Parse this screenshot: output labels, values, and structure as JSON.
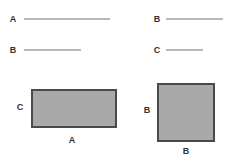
{
  "diagram": {
    "segments": [
      {
        "label": "A",
        "label_x": 13,
        "label_y": 19,
        "x1": 24,
        "x2": 110,
        "y": 19
      },
      {
        "label": "B",
        "label_x": 13,
        "label_y": 50,
        "x1": 24,
        "x2": 81,
        "y": 50
      },
      {
        "label": "B",
        "label_x": 157,
        "label_y": 19,
        "x1": 166,
        "x2": 223,
        "y": 19
      },
      {
        "label": "C",
        "label_x": 157,
        "label_y": 50,
        "x1": 166,
        "x2": 203,
        "y": 50
      }
    ],
    "rectangles": [
      {
        "name": "rectangle-A-by-C",
        "x": 31,
        "y": 89,
        "w": 86,
        "h": 39,
        "side_label": "C",
        "side_label_x": 20,
        "side_label_y": 107,
        "bottom_label": "A",
        "bottom_label_x": 72,
        "bottom_label_y": 140
      },
      {
        "name": "square-B-by-B",
        "x": 157,
        "y": 83,
        "w": 58,
        "h": 59,
        "side_label": "B",
        "side_label_x": 147,
        "side_label_y": 110,
        "bottom_label": "B",
        "bottom_label_x": 186,
        "bottom_label_y": 151
      }
    ],
    "colors": {
      "line": "#b8b8b8",
      "fill": "#a9a9a9",
      "border": "#4a4a4a",
      "text": "#333333"
    }
  }
}
